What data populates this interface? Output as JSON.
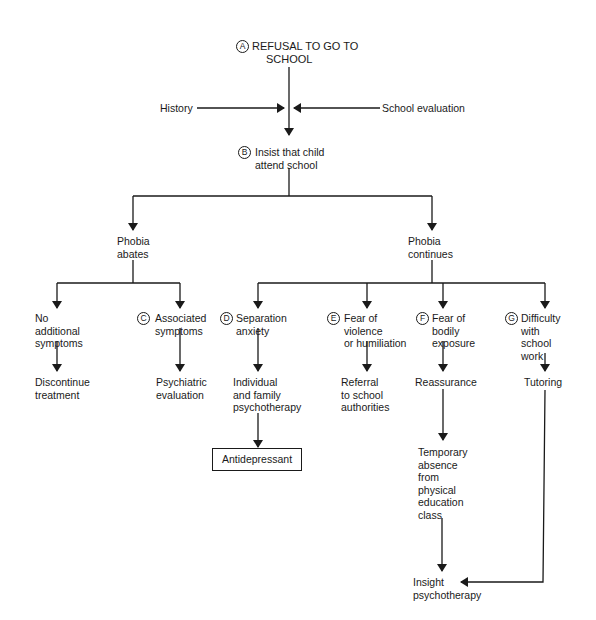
{
  "diagram": {
    "type": "flowchart",
    "nodes": {
      "A": {
        "badge": "A",
        "lines": [
          "REFUSAL TO GO TO",
          "SCHOOL"
        ]
      },
      "history": {
        "lines": [
          "History"
        ]
      },
      "school_eval": {
        "lines": [
          "School evaluation"
        ]
      },
      "B": {
        "badge": "B",
        "lines": [
          "Insist that child",
          "attend school"
        ]
      },
      "abates": {
        "lines": [
          "Phobia",
          "abates"
        ]
      },
      "continues": {
        "lines": [
          "Phobia",
          "continues"
        ]
      },
      "no_symptoms": {
        "lines": [
          "No",
          "additional",
          "symptoms"
        ]
      },
      "C": {
        "badge": "C",
        "lines": [
          "Associated",
          "symptoms"
        ]
      },
      "D": {
        "badge": "D",
        "lines": [
          "Separation",
          "anxiety"
        ]
      },
      "E": {
        "badge": "E",
        "lines": [
          "Fear of",
          "violence",
          "or humiliation"
        ]
      },
      "F": {
        "badge": "F",
        "lines": [
          "Fear of",
          "bodily",
          "exposure"
        ]
      },
      "G": {
        "badge": "G",
        "lines": [
          "Difficulty",
          "with",
          "school",
          "work"
        ]
      },
      "discontinue": {
        "lines": [
          "Discontinue",
          "treatment"
        ]
      },
      "psych_eval": {
        "lines": [
          "Psychiatric",
          "evaluation"
        ]
      },
      "family_therapy": {
        "lines": [
          "Individual",
          "and family",
          "psychotherapy"
        ]
      },
      "referral": {
        "lines": [
          "Referral",
          "to school",
          "authorities"
        ]
      },
      "reassurance": {
        "lines": [
          "Reassurance"
        ]
      },
      "tutoring": {
        "lines": [
          "Tutoring"
        ]
      },
      "antidepressant": {
        "lines": [
          "Antidepressant"
        ]
      },
      "temp_absence": {
        "lines": [
          "Temporary",
          "absence",
          "from",
          "physical",
          "education",
          "class"
        ]
      },
      "insight": {
        "lines": [
          "Insight",
          "psychotherapy"
        ]
      }
    },
    "edges": [
      [
        "A",
        "B"
      ],
      [
        "history",
        "A-B"
      ],
      [
        "school_eval",
        "A-B"
      ],
      [
        "B",
        "abates"
      ],
      [
        "B",
        "continues"
      ],
      [
        "abates",
        "no_symptoms"
      ],
      [
        "abates",
        "C"
      ],
      [
        "continues",
        "D"
      ],
      [
        "continues",
        "E"
      ],
      [
        "continues",
        "F"
      ],
      [
        "continues",
        "G"
      ],
      [
        "no_symptoms",
        "discontinue"
      ],
      [
        "C",
        "psych_eval"
      ],
      [
        "D",
        "family_therapy"
      ],
      [
        "family_therapy",
        "antidepressant"
      ],
      [
        "E",
        "referral"
      ],
      [
        "F",
        "reassurance"
      ],
      [
        "reassurance",
        "temp_absence"
      ],
      [
        "temp_absence",
        "insight"
      ],
      [
        "G",
        "tutoring"
      ],
      [
        "tutoring",
        "insight"
      ]
    ],
    "colors": {
      "ink": "#1a1a1a",
      "background": "#ffffff"
    }
  }
}
